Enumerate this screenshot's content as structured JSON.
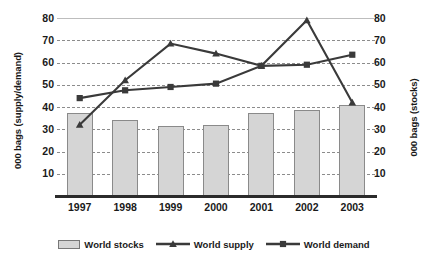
{
  "chart_data": {
    "type": "bar",
    "title": "",
    "subtitle": "",
    "xlabel": "",
    "ylabel": "000 bags (supply/demand)",
    "y2label": "000 bags (stocks)",
    "categories": [
      "1997",
      "1998",
      "1999",
      "2000",
      "2001",
      "2002",
      "2003"
    ],
    "ylim": [
      0,
      80
    ],
    "y2lim": [
      0,
      80
    ],
    "yticks": [
      10,
      20,
      30,
      40,
      50,
      60,
      70,
      80
    ],
    "y2ticks": [
      10,
      20,
      30,
      40,
      50,
      60,
      70,
      80
    ],
    "grid": true,
    "legend_position": "bottom",
    "series": [
      {
        "name": "World stocks",
        "type": "bar",
        "axis": "right",
        "color": "#d5d5d5",
        "marker": "none",
        "values": [
          37.5,
          34,
          31.5,
          32,
          37.5,
          38.5,
          41
        ]
      },
      {
        "name": "World supply",
        "type": "line",
        "axis": "left",
        "color": "#3a3a3a",
        "marker": "triangle",
        "values": [
          32,
          52,
          68.5,
          64,
          58.5,
          79,
          42
        ]
      },
      {
        "name": "World demand",
        "type": "line",
        "axis": "left",
        "color": "#3a3a3a",
        "marker": "square",
        "values": [
          44,
          47.5,
          49,
          50.5,
          58.5,
          59,
          63.5
        ]
      }
    ]
  },
  "axes": {
    "left_title": "000 bags (supply/demand)",
    "right_title": "000 bags (stocks)",
    "left_ticks": [
      "80",
      "70",
      "60",
      "50",
      "40",
      "30",
      "20",
      "10"
    ],
    "right_ticks": [
      "80",
      "70",
      "60",
      "50",
      "40",
      "30",
      "20",
      "10"
    ],
    "x_labels": [
      "1997",
      "1998",
      "1999",
      "2000",
      "2001",
      "2002",
      "2003"
    ]
  },
  "legend": {
    "items": [
      {
        "label": "World stocks",
        "marker": "bar-swatch"
      },
      {
        "label": "World supply",
        "marker": "line-triangle"
      },
      {
        "label": "World demand",
        "marker": "line-square"
      }
    ]
  }
}
